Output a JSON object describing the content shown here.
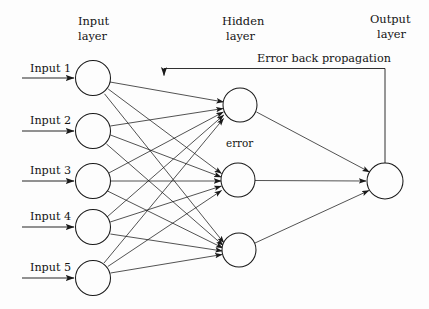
{
  "diagram": {
    "title_labels": {
      "input_layer": "Input\nlayer",
      "input_layer_line1": "Input",
      "input_layer_line2": "layer",
      "hidden_layer_line1": "Hidden",
      "hidden_layer_line2": "layer",
      "output_layer_line1": "Output",
      "output_layer_line2": "layer"
    },
    "annotations": {
      "error": "error",
      "back_propagation": "Error back propagation"
    },
    "colors": {
      "background": "#fdfdfd",
      "stroke": "#1a1a1a",
      "node_fill": "#fdfdfd",
      "text": "#141414"
    },
    "input_layer": {
      "nodes": [
        {
          "label": "Input 1",
          "cx": 93,
          "cy": 78,
          "r": 17.5
        },
        {
          "label": "Input 2",
          "cx": 93,
          "cy": 131,
          "r": 17.5
        },
        {
          "label": "Input 3",
          "cx": 93,
          "cy": 181,
          "r": 17.5
        },
        {
          "label": "Input 4",
          "cx": 93,
          "cy": 227,
          "r": 17.5
        },
        {
          "label": "Input 5",
          "cx": 93,
          "cy": 278,
          "r": 17.5
        }
      ]
    },
    "hidden_layer": {
      "nodes": [
        {
          "label": "",
          "cx": 240,
          "cy": 105,
          "r": 17
        },
        {
          "label": "",
          "cx": 238,
          "cy": 180,
          "r": 17
        },
        {
          "label": "",
          "cx": 239,
          "cy": 250,
          "r": 17
        }
      ]
    },
    "output_layer": {
      "nodes": [
        {
          "label": "",
          "cx": 385,
          "cy": 181,
          "r": 18
        }
      ]
    },
    "connectivity": {
      "input_to_hidden": "fully-connected",
      "hidden_to_output": "fully-connected",
      "backprop_path": "output-node-top to hidden-layer-left"
    }
  }
}
